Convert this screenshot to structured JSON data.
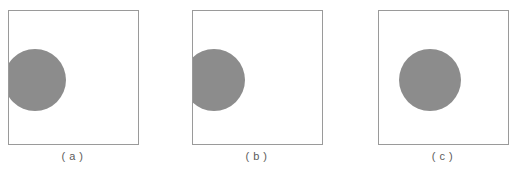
{
  "figure": {
    "background_color": "#ffffff",
    "frame_color": "#9a9a9a",
    "disc_color": "#8c8c8c",
    "caption_color": "#5c5c5c",
    "panels": [
      {
        "caption": "( a )",
        "disc": {
          "center_x_pct": 21,
          "center_y_pct": 52,
          "diameter_px": 62,
          "clipped_edge": "left"
        }
      },
      {
        "caption": "( b )",
        "disc": {
          "center_x_pct": 17,
          "center_y_pct": 52,
          "diameter_px": 62,
          "clipped_edge": "left"
        }
      },
      {
        "caption": "( c )",
        "disc": {
          "center_x_pct": 40,
          "center_y_pct": 52,
          "diameter_px": 62,
          "clipped_edge": "none"
        }
      }
    ]
  }
}
